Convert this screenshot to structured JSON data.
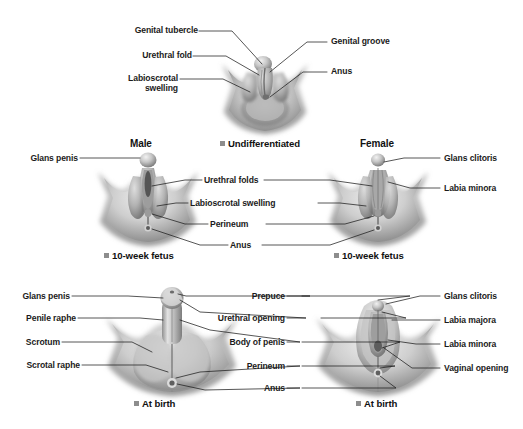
{
  "figure": {
    "bullet_color": "#8d8d8d",
    "leader_color": "#1d1d1d"
  },
  "panels": {
    "undifferentiated": {
      "caption": "Undifferentiated",
      "labels_left": [
        {
          "text": "Genital tubercle"
        },
        {
          "text": "Urethral fold"
        },
        {
          "text": "Labioscrotal swelling"
        }
      ],
      "labels_right": [
        {
          "text": "Genital groove"
        },
        {
          "text": "Anus"
        }
      ]
    },
    "fetus": {
      "heading_male": "Male",
      "heading_female": "Female",
      "caption_male": "10-week fetus",
      "caption_female": "10-week fetus",
      "labels_left": [
        {
          "text": "Glans penis"
        }
      ],
      "labels_center": [
        {
          "text": "Urethral folds"
        },
        {
          "text": "Labioscrotal swelling"
        },
        {
          "text": "Perineum"
        },
        {
          "text": "Anus"
        }
      ],
      "labels_right": [
        {
          "text": "Glans clitoris"
        },
        {
          "text": "Labia minora"
        }
      ]
    },
    "birth": {
      "caption_male": "At birth",
      "caption_female": "At birth",
      "labels_left": [
        {
          "text": "Glans penis"
        },
        {
          "text": "Penile raphe"
        },
        {
          "text": "Scrotum"
        },
        {
          "text": "Scrotal raphe"
        }
      ],
      "labels_center": [
        {
          "text": "Prepuce"
        },
        {
          "text": "Urethral opening"
        },
        {
          "text": "Body of penis"
        },
        {
          "text": "Perineum"
        },
        {
          "text": "Anus"
        }
      ],
      "labels_right": [
        {
          "text": "Glans clitoris"
        },
        {
          "text": "Labia majora"
        },
        {
          "text": "Labia minora"
        },
        {
          "text": "Vaginal opening"
        }
      ]
    }
  }
}
